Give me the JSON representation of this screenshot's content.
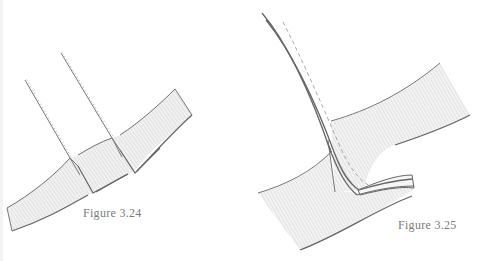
{
  "figures": [
    {
      "id": "fig-3-24",
      "caption": "Figure 3.24",
      "description": "Two pleated strips folded over a diagonal band"
    },
    {
      "id": "fig-3-25",
      "caption": "Figure 3.25",
      "description": "Curved strip folded through a slit between two bands, with dashed stitch line"
    }
  ],
  "colors": {
    "line": "#6e6e6e",
    "hatch": "#c8c8c8",
    "fill": "#f1f1f1",
    "caption": "#7a7a7a",
    "background": "#ffffff"
  }
}
